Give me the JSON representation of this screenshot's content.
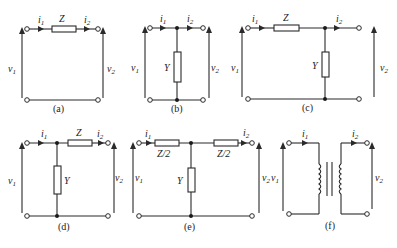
{
  "figure": {
    "panels": [
      {
        "id": "a",
        "caption": "(a)",
        "series": "Z",
        "shunt": "",
        "i1": "i",
        "i2": "i",
        "v1": "v",
        "v2": "v",
        "sub1": "1",
        "sub2": "2"
      },
      {
        "id": "b",
        "caption": "(b)",
        "series": "",
        "shunt": "Y",
        "i1": "i",
        "i2": "i",
        "v1": "v",
        "v2": "v",
        "sub1": "1",
        "sub2": "2"
      },
      {
        "id": "c",
        "caption": "(c)",
        "series": "Z",
        "shunt": "Y",
        "i1": "i",
        "i2": "i",
        "v1": "v",
        "v2": "v",
        "sub1": "1",
        "sub2": "2"
      },
      {
        "id": "d",
        "caption": "(d)",
        "series": "Z",
        "shunt": "Y",
        "i1": "i",
        "i2": "i",
        "v1": "v",
        "v2": "v",
        "sub1": "1",
        "sub2": "2"
      },
      {
        "id": "e",
        "caption": "(e)",
        "series_left": "Z/2",
        "series_right": "Z/2",
        "shunt": "Y",
        "i1": "i",
        "i2": "i",
        "v1": "v",
        "v2": "v",
        "sub1": "1",
        "sub2": "2"
      },
      {
        "id": "f",
        "caption": "(f)",
        "element": "transformer",
        "i1": "i",
        "i2": "i",
        "v1": "v",
        "v2": "v",
        "sub1": "1",
        "sub2": "2"
      }
    ]
  }
}
